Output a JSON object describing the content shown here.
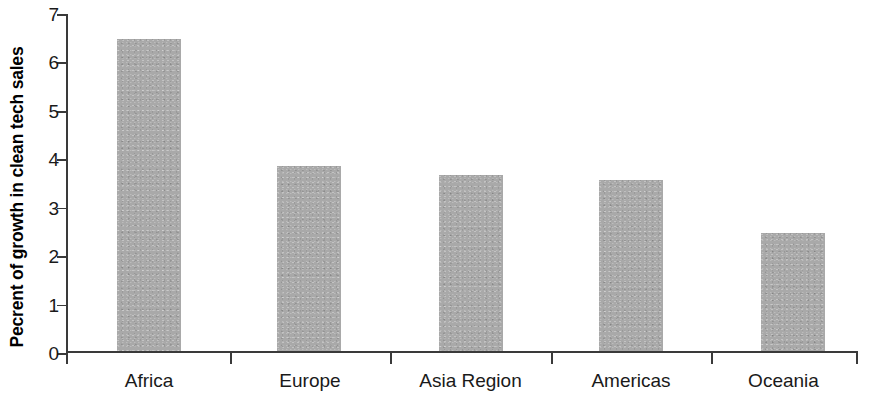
{
  "chart_data": {
    "type": "bar",
    "title": "",
    "subtitle": "",
    "xlabel": "",
    "ylabel": "Pecrent of growth in clean tech sales",
    "categories": [
      "Africa",
      "Europe",
      "Asia Region",
      "Americas",
      "Oceania"
    ],
    "values": [
      6.48,
      3.85,
      3.66,
      3.55,
      2.46
    ],
    "series": [
      {
        "name": "Percent of growth in clean tech sales",
        "values": [
          6.48,
          3.85,
          3.66,
          3.55,
          2.46
        ]
      }
    ],
    "ylim": [
      0,
      7
    ],
    "ytick_labels": [
      "0",
      "1",
      "2",
      "3",
      "4",
      "5",
      "6",
      "7"
    ],
    "ytick_values": [
      0,
      1,
      2,
      3,
      4,
      5,
      6,
      7
    ],
    "grid": false,
    "legend": false,
    "legend_position": "none",
    "bar_color": "#a9a9a9",
    "axis_color": "#3a3a3a",
    "text_color": "#1a1a1a",
    "background_color": "#ffffff"
  }
}
